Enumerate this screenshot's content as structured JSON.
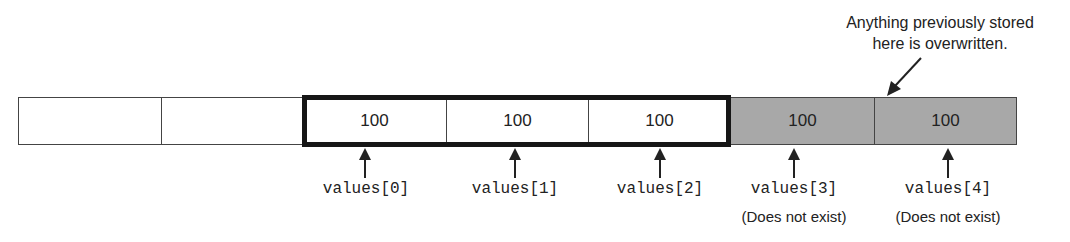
{
  "diagram": {
    "cells": [
      {
        "value": "",
        "state": "unused"
      },
      {
        "value": "",
        "state": "unused"
      },
      {
        "value": "100",
        "state": "array"
      },
      {
        "value": "100",
        "state": "array"
      },
      {
        "value": "100",
        "state": "array"
      },
      {
        "value": "100",
        "state": "out-of-bounds"
      },
      {
        "value": "100",
        "state": "out-of-bounds"
      }
    ],
    "labels": [
      "values[0]",
      "values[1]",
      "values[2]",
      "values[3]",
      "values[4]"
    ],
    "notes": [
      "(Does not exist)",
      "(Does not exist)"
    ],
    "callout": {
      "line1": "Anything previously stored",
      "line2": "here is overwritten."
    },
    "colors": {
      "out_of_bounds_fill": "#a8a8a8",
      "array_border": "#161616",
      "text": "#222222"
    }
  }
}
